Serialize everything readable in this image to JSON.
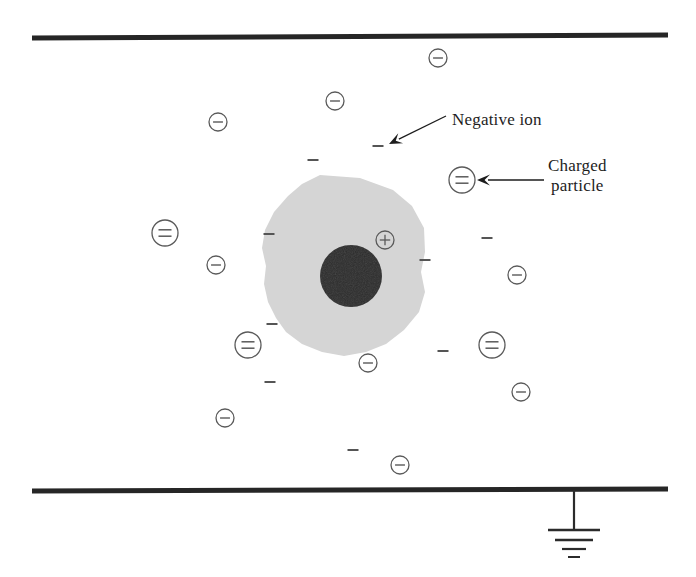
{
  "figure": {
    "background_color": "#ffffff",
    "width": 696,
    "height": 577
  },
  "colors": {
    "electrode": "#262626",
    "ion_stroke": "#5a5a5a",
    "dash_stroke": "#555555",
    "blob_fill": "#d5d5d5",
    "core_fill": "#2b2b2b",
    "text": "#1d1d1d",
    "arrow": "#1d1d1d",
    "ground": "#2b2b2b"
  },
  "annotations": [
    {
      "name": "negative-ion-callout",
      "text": "Negative ion",
      "x": 452,
      "y": 110,
      "lines": [
        "Negative ion"
      ]
    },
    {
      "name": "charged-particle-callout",
      "text": "Charged particle",
      "x": 548,
      "y": 156,
      "lines": [
        "Charged",
        "particle"
      ]
    }
  ],
  "electrodes": [
    {
      "name": "top-electrode",
      "x1": 32,
      "y1": 38,
      "x2": 668,
      "y2": 35,
      "width": 5
    },
    {
      "name": "bottom-electrode",
      "x1": 32,
      "y1": 491,
      "x2": 668,
      "y2": 489,
      "width": 5
    }
  ],
  "ground_symbol": {
    "name": "ground-symbol",
    "stem": {
      "x": 574,
      "y1": 490,
      "y2": 530
    },
    "bars": [
      {
        "half_width": 26,
        "y": 530,
        "width": 2.6
      },
      {
        "half_width": 19,
        "y": 540,
        "width": 2.4
      },
      {
        "half_width": 12,
        "y": 549,
        "width": 2.2
      },
      {
        "half_width": 6,
        "y": 557,
        "width": 2.0
      }
    ]
  },
  "arrows": [
    {
      "name": "negative-ion-arrow",
      "from": {
        "x": 446,
        "y": 116
      },
      "to": {
        "x": 389,
        "y": 144
      },
      "head_size": 13
    },
    {
      "name": "charged-particle-arrow",
      "from": {
        "x": 544,
        "y": 180
      },
      "to": {
        "x": 477,
        "y": 180
      },
      "head_size": 13
    }
  ],
  "particle": {
    "name": "dust-particle",
    "blob_points": "320,175 360,178 393,190 412,206 424,228 425,252 421,272 425,292 419,312 404,330 386,344 366,352 344,356 322,352 302,344 286,332 276,318 268,302 264,284 266,266 262,248 265,230 274,212 288,196 302,184",
    "core": {
      "cx": 351,
      "cy": 276,
      "r": 31
    },
    "plus_sign": {
      "cx": 385,
      "cy": 240,
      "r": 9,
      "symbol": "+"
    }
  },
  "negative_ions": [
    {
      "name": "negative-ion",
      "cx": 438,
      "cy": 58,
      "r": 9
    },
    {
      "name": "negative-ion",
      "cx": 335,
      "cy": 101,
      "r": 9
    },
    {
      "name": "negative-ion",
      "cx": 218,
      "cy": 122,
      "r": 9
    },
    {
      "name": "negative-ion",
      "cx": 216,
      "cy": 265,
      "r": 9
    },
    {
      "name": "negative-ion",
      "cx": 517,
      "cy": 275,
      "r": 9
    },
    {
      "name": "negative-ion",
      "cx": 368,
      "cy": 363,
      "r": 9
    },
    {
      "name": "negative-ion",
      "cx": 521,
      "cy": 392,
      "r": 9
    },
    {
      "name": "negative-ion",
      "cx": 225,
      "cy": 418,
      "r": 9
    },
    {
      "name": "negative-ion",
      "cx": 400,
      "cy": 465,
      "r": 9
    }
  ],
  "charged_particles": [
    {
      "name": "charged-particle",
      "cx": 165,
      "cy": 233,
      "r": 13
    },
    {
      "name": "charged-particle",
      "cx": 462,
      "cy": 180,
      "r": 13
    },
    {
      "name": "charged-particle",
      "cx": 248,
      "cy": 345,
      "r": 13
    },
    {
      "name": "charged-particle",
      "cx": 492,
      "cy": 345,
      "r": 13
    }
  ],
  "free_charges": [
    {
      "name": "minus-dash",
      "cx": 313,
      "cy": 160,
      "w": 11
    },
    {
      "name": "minus-dash",
      "cx": 378,
      "cy": 146,
      "w": 11
    },
    {
      "name": "minus-dash",
      "cx": 269,
      "cy": 234,
      "w": 11
    },
    {
      "name": "minus-dash",
      "cx": 425,
      "cy": 260,
      "w": 11
    },
    {
      "name": "minus-dash",
      "cx": 487,
      "cy": 238,
      "w": 11
    },
    {
      "name": "minus-dash",
      "cx": 272,
      "cy": 324,
      "w": 11
    },
    {
      "name": "minus-dash",
      "cx": 443,
      "cy": 351,
      "w": 11
    },
    {
      "name": "minus-dash",
      "cx": 270,
      "cy": 382,
      "w": 11
    },
    {
      "name": "minus-dash",
      "cx": 353,
      "cy": 450,
      "w": 11
    }
  ]
}
